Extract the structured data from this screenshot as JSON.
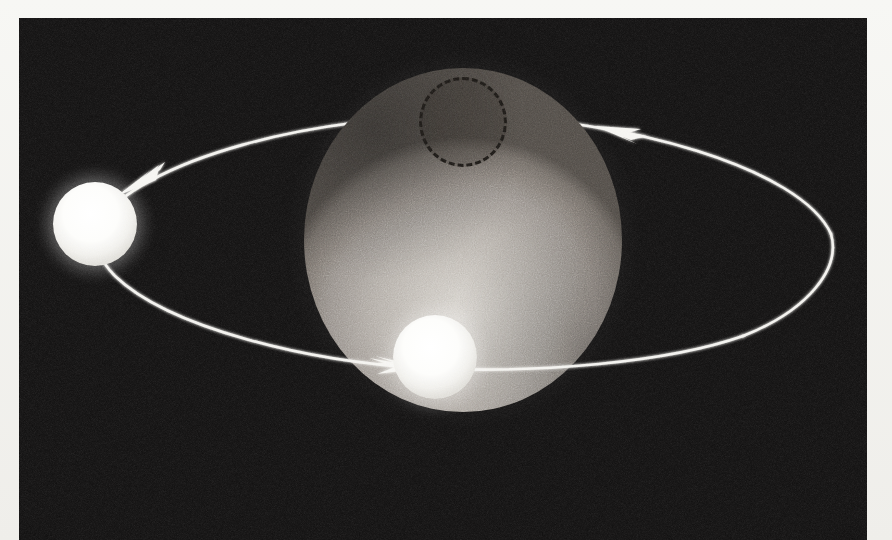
{
  "figure": {
    "medium": "halftone photographic plate",
    "background_color": "#0c0b0b",
    "paper_color": "#f7f7f4",
    "caption": "",
    "width": 892,
    "height": 540
  },
  "plate": {
    "x": 19,
    "y": 18,
    "width": 848,
    "height": 522
  },
  "planet": {
    "name": "planet-sphere",
    "label": "",
    "center_x": 463,
    "center_y": 240,
    "radius_x": 159,
    "radius_y": 172,
    "surface_color": "#b4aea7",
    "highlight_color": "#dedad4",
    "terminator_color": "#4c4742"
  },
  "region_marker": {
    "name": "dashed-region",
    "label": "",
    "center_x": 463,
    "center_y": 122,
    "radius_x": 44,
    "radius_y": 45,
    "stroke_color": "#15120f",
    "stroke_style": "dashed",
    "fill_tint": "rgba(28,24,20,0.20)"
  },
  "satellites": [
    {
      "name": "satellite-left",
      "label": "",
      "center_x": 95,
      "center_y": 224,
      "radius": 42,
      "color": "#fdfdfb",
      "position_note": "far side of orbit, left of planet"
    },
    {
      "name": "satellite-front",
      "label": "",
      "center_x": 435,
      "center_y": 357,
      "radius": 42,
      "color": "#fdfdfb",
      "position_note": "near side of orbit, crossing planet disc"
    }
  ],
  "orbit": {
    "name": "orbit-ellipse",
    "label": "",
    "center_x": 452,
    "center_y": 222,
    "radius_x": 380,
    "radius_y": 118,
    "tilt_degrees": -4,
    "stroke_color": "#f2f1ed",
    "stroke_width": 3,
    "direction": "counter-clockwise as drawn"
  },
  "arrows": [
    {
      "name": "orbit-arrow-upper-left",
      "label": "",
      "tip_x": 117,
      "tip_y": 195,
      "direction": "down-left",
      "color": "#f5f4f0"
    },
    {
      "name": "orbit-arrow-upper-right",
      "label": "",
      "tip_x": 598,
      "tip_y": 124,
      "direction": "left",
      "color": "#f5f4f0"
    },
    {
      "name": "orbit-arrow-lower-center",
      "label": "",
      "tip_x": 404,
      "tip_y": 368,
      "direction": "right",
      "color": "#f5f4f0"
    }
  ]
}
